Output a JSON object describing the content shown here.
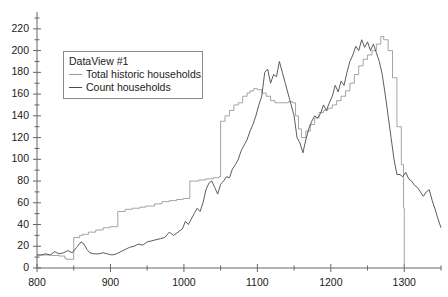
{
  "legend": {
    "title": "DataView #1",
    "entries": [
      {
        "label": "Total historic households",
        "color": "#9a9a9a"
      },
      {
        "label": "Count households",
        "color": "#4a4a4a"
      }
    ]
  },
  "axes": {
    "x_ticks": [
      "800",
      "900",
      "1000",
      "1100",
      "1200",
      "1300"
    ],
    "y_ticks": [
      "0",
      "20",
      "40",
      "60",
      "80",
      "100",
      "120",
      "140",
      "160",
      "180",
      "200",
      "220"
    ]
  },
  "chart_data": {
    "type": "line",
    "title": "",
    "xlabel": "",
    "ylabel": "",
    "xlim": [
      800,
      1350
    ],
    "ylim": [
      0,
      230
    ],
    "grid": false,
    "legend_position": "upper-left-inside",
    "x_ticks": [
      800,
      900,
      1000,
      1100,
      1200,
      1300
    ],
    "y_ticks": [
      0,
      20,
      40,
      60,
      80,
      100,
      120,
      140,
      160,
      180,
      200,
      220
    ],
    "x_minor_tick_step": 50,
    "y_minor_tick_step": 10,
    "series": [
      {
        "name": "Total historic households",
        "color": "#9a9a9a",
        "style": "step",
        "x": [
          800,
          810,
          820,
          830,
          838,
          840,
          849,
          850,
          858,
          862,
          870,
          880,
          890,
          899,
          900,
          910,
          920,
          930,
          940,
          948,
          950,
          960,
          970,
          980,
          990,
          999,
          1000,
          1008,
          1012,
          1020,
          1030,
          1040,
          1048,
          1050,
          1056,
          1062,
          1068,
          1074,
          1080,
          1086,
          1090,
          1095,
          1100,
          1106,
          1112,
          1118,
          1124,
          1130,
          1136,
          1142,
          1148,
          1152,
          1156,
          1160,
          1166,
          1172,
          1178,
          1184,
          1190,
          1196,
          1202,
          1208,
          1214,
          1220,
          1226,
          1232,
          1238,
          1244,
          1250,
          1256,
          1262,
          1268,
          1272,
          1278,
          1284,
          1290,
          1296,
          1299,
          1300
        ],
        "y": [
          12,
          12,
          11.5,
          11,
          9,
          8,
          8,
          28,
          30,
          31,
          33,
          35,
          37,
          38,
          38,
          52,
          54,
          55,
          56,
          57,
          57,
          59,
          61,
          62,
          63,
          64,
          64,
          80,
          80,
          81,
          82,
          83,
          84,
          135,
          140,
          145,
          150,
          152,
          158,
          161,
          163,
          165,
          164,
          161,
          158,
          154,
          152,
          152,
          152,
          153,
          152,
          140,
          128,
          120,
          126,
          132,
          138,
          143,
          145,
          147,
          150,
          154,
          158,
          163,
          170,
          178,
          186,
          192,
          196,
          200,
          206,
          213,
          210,
          200,
          175,
          130,
          95,
          55,
          0
        ]
      },
      {
        "name": "Count households",
        "color": "#4a4a4a",
        "style": "line",
        "x": [
          800,
          806,
          812,
          818,
          824,
          830,
          836,
          842,
          848,
          854,
          860,
          864,
          868,
          872,
          878,
          884,
          890,
          896,
          902,
          908,
          914,
          920,
          926,
          932,
          938,
          944,
          950,
          956,
          962,
          968,
          974,
          980,
          986,
          992,
          998,
          1002,
          1006,
          1010,
          1014,
          1018,
          1022,
          1026,
          1030,
          1034,
          1038,
          1042,
          1046,
          1050,
          1054,
          1058,
          1062,
          1066,
          1070,
          1074,
          1078,
          1082,
          1086,
          1090,
          1094,
          1098,
          1102,
          1106,
          1110,
          1114,
          1118,
          1122,
          1126,
          1130,
          1134,
          1138,
          1142,
          1146,
          1150,
          1154,
          1158,
          1162,
          1166,
          1170,
          1174,
          1178,
          1182,
          1186,
          1190,
          1194,
          1198,
          1202,
          1206,
          1210,
          1214,
          1218,
          1222,
          1226,
          1230,
          1234,
          1238,
          1242,
          1246,
          1250,
          1254,
          1258,
          1262,
          1266,
          1270,
          1274,
          1278,
          1282,
          1286,
          1290,
          1294,
          1298,
          1302,
          1306,
          1310,
          1314,
          1318,
          1322,
          1326,
          1330,
          1334,
          1338,
          1342,
          1346,
          1350
        ],
        "y": [
          12,
          12,
          13,
          12,
          15,
          13,
          14,
          16,
          14,
          19,
          24,
          22,
          17,
          14,
          13,
          13,
          14,
          13,
          12,
          13,
          15,
          17,
          19,
          20,
          22,
          21,
          24,
          25,
          26,
          27,
          28,
          33,
          30,
          33,
          36,
          43,
          40,
          45,
          50,
          55,
          52,
          60,
          72,
          78,
          80,
          74,
          68,
          77,
          80,
          84,
          83,
          91,
          95,
          100,
          108,
          113,
          118,
          126,
          132,
          140,
          150,
          158,
          180,
          183,
          170,
          178,
          176,
          190,
          180,
          170,
          160,
          150,
          140,
          120,
          115,
          106,
          118,
          128,
          135,
          140,
          138,
          142,
          150,
          145,
          152,
          158,
          168,
          162,
          172,
          168,
          180,
          190,
          196,
          204,
          200,
          210,
          203,
          208,
          200,
          206,
          198,
          190,
          178,
          160,
          140,
          120,
          100,
          86,
          86,
          84,
          88,
          82,
          80,
          76,
          74,
          70,
          66,
          70,
          72,
          62,
          54,
          45,
          37
        ]
      }
    ]
  }
}
